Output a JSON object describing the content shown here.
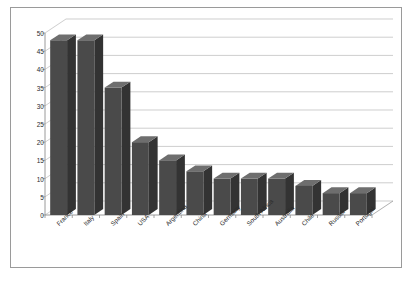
{
  "chart_data": {
    "type": "bar",
    "title": "",
    "xlabel": "",
    "ylabel": "",
    "categories": [
      "France",
      "Italy",
      "Spain",
      "USA",
      "Argentina",
      "China",
      "Germany",
      "South Africa",
      "Australia",
      "Chile",
      "Russia",
      "Portugal"
    ],
    "values": [
      48,
      48,
      35,
      20,
      15,
      12,
      10,
      10,
      10,
      8,
      6,
      6
    ],
    "ylim": [
      0,
      50
    ],
    "yticks": [
      0,
      5,
      10,
      15,
      20,
      25,
      30,
      35,
      40,
      45,
      50
    ],
    "ytick_labels": [
      "0",
      "5",
      "10",
      "15",
      "20",
      "25",
      "30",
      "35",
      "40",
      "45",
      "50"
    ],
    "grid": true,
    "legend": false,
    "style": "3d-column",
    "series": [
      {
        "name": "Series 1",
        "values": [
          48,
          48,
          35,
          20,
          15,
          12,
          10,
          10,
          10,
          8,
          6,
          6
        ]
      }
    ],
    "colors": {
      "bar_front": "#4a4a4a",
      "bar_top": "#6e6e6e",
      "bar_side": "#333333",
      "gridline": "#b9b9b9",
      "axis": "#8e8e8e",
      "frame": "#9a9a9a",
      "background": "#ffffff",
      "text": "#2a2a2a"
    }
  }
}
